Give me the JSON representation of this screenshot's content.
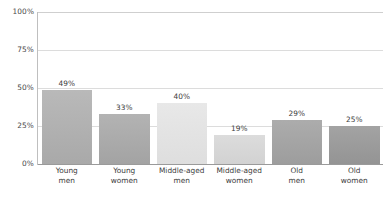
{
  "chart_data": {
    "type": "bar",
    "title": "",
    "subtitle": "",
    "xlabel": "",
    "ylabel": "",
    "ylim": [
      0,
      100
    ],
    "grid": true,
    "legend": "none",
    "categories": [
      "Young men",
      "Young women",
      "Middle-aged men",
      "Middle-aged women",
      "Old men",
      "Old women"
    ],
    "category_lines": [
      [
        "Young",
        "men"
      ],
      [
        "Young",
        "women"
      ],
      [
        "Middle-aged",
        "men"
      ],
      [
        "Middle-aged",
        "women"
      ],
      [
        "Old",
        "men"
      ],
      [
        "Old",
        "women"
      ]
    ],
    "values": [
      49,
      33,
      40,
      19,
      29,
      25
    ],
    "value_labels": [
      "49%",
      "33%",
      "40%",
      "19%",
      "29%",
      "25%"
    ],
    "bar_colors": [
      "#a9a9a9",
      "#a3a3a3",
      "#dedede",
      "#d2d2d2",
      "#9d9d9d",
      "#949494"
    ],
    "bar_colors_top": [
      "#b9b9b9",
      "#b3b3b3",
      "#e8e8e8",
      "#dcdcdc",
      "#acacac",
      "#a3a3a3"
    ],
    "yticks": [
      0,
      25,
      50,
      75,
      100
    ],
    "ytick_labels": [
      "0%",
      "25%",
      "50%",
      "75%",
      "100%"
    ]
  },
  "axes": {
    "gridline_color": "#dcdcdc",
    "baseline_color": "#9a9a9a",
    "axis_color": "#bfbfbf"
  },
  "caption": {
    "cut_off_text": " "
  }
}
